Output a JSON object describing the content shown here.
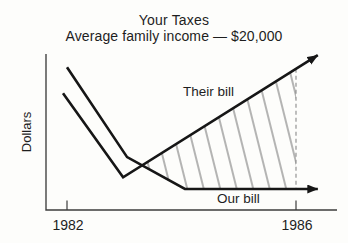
{
  "chart_data": {
    "type": "line",
    "title": "Your Taxes",
    "subtitle": "Average family income — $20,000",
    "ylabel": "Dollars",
    "xlabel": "",
    "grid": false,
    "x_range": [
      1981.9,
      1986.5
    ],
    "y_axis_note": "unlabeled relative dollars, 0-100",
    "x_ticks": [
      {
        "value": 1982,
        "label": "1982"
      },
      {
        "value": 1986,
        "label": "1986"
      }
    ],
    "series": [
      {
        "name": "Their bill",
        "arrow_end": true,
        "points": [
          [
            1981.93,
            75.0
          ],
          [
            1982.98,
            21.0
          ],
          [
            1986.38,
            99.4
          ]
        ]
      },
      {
        "name": "Our bill",
        "arrow_end": true,
        "points": [
          [
            1982.0,
            91.7
          ],
          [
            1983.05,
            34.0
          ],
          [
            1984.06,
            13.5
          ],
          [
            1986.38,
            13.5
          ]
        ]
      }
    ],
    "hatched_region": {
      "style": "diagonal-hatch",
      "points": [
        [
          1983.313,
          28.67
        ],
        [
          1986,
          90.64
        ],
        [
          1986,
          13.5
        ],
        [
          1984.06,
          13.5
        ]
      ]
    },
    "dashed_guide": {
      "x": 1986,
      "y_from": 13.5,
      "y_to": 90.64
    }
  },
  "colors": {
    "ink": "#161616",
    "axis": "#3c3c3c",
    "hatch": "#4f4f4f",
    "dashed": "#8a8a8a",
    "text": "#1e1e1e",
    "background": "#fdfdfb"
  }
}
